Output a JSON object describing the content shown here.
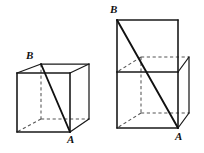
{
  "figure_set": {
    "title": "",
    "background_color": "#ffffff",
    "line_color": "#1a1a1a",
    "hidden_line_color": "#555555",
    "figures": [
      {
        "name": "left-cube",
        "description": "single cube with diagonal from B to A",
        "labels": {
          "vertex_b": "B",
          "vertex_a": "A"
        }
      },
      {
        "name": "right-prism",
        "description": "two stacked cubes forming a tall rectangular prism with diagonal from B to A",
        "labels": {
          "vertex_b": "B",
          "vertex_a": "A"
        }
      }
    ]
  },
  "left_figure": {
    "label_b": "B",
    "label_a": "A"
  },
  "right_figure": {
    "label_b": "B",
    "label_a": "A"
  }
}
